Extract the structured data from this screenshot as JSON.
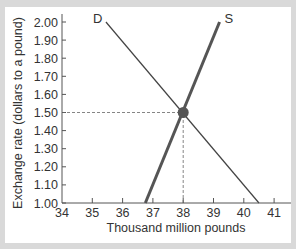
{
  "chart_data": {
    "type": "line",
    "title": "",
    "xlabel": "Thousand million pounds",
    "ylabel": "Exchange rate (dollars to a pound)",
    "xlim": [
      34,
      41.5
    ],
    "ylim": [
      1.0,
      2.05
    ],
    "xticks": [
      "34",
      "35",
      "36",
      "37",
      "38",
      "39",
      "40",
      "41"
    ],
    "yticks": [
      "1.00",
      "1.10",
      "1.20",
      "1.30",
      "1.40",
      "1.50",
      "1.60",
      "1.70",
      "1.80",
      "1.90",
      "2.00"
    ],
    "grid": false,
    "series": [
      {
        "name": "D",
        "label": "D",
        "points": [
          [
            35.45,
            2.0
          ],
          [
            40.5,
            1.0
          ]
        ],
        "color": "#444444",
        "width": 1.2
      },
      {
        "name": "S",
        "label": "S",
        "points": [
          [
            36.75,
            1.0
          ],
          [
            39.2,
            2.0
          ]
        ],
        "color": "#555555",
        "width": 3
      }
    ],
    "equilibrium": {
      "x": 38,
      "y": 1.5,
      "color": "#555555"
    },
    "reference_lines": [
      {
        "type": "horizontal",
        "y": 1.5,
        "from_x": 34,
        "to_x": 38,
        "style": "dashed"
      },
      {
        "type": "vertical",
        "x": 38,
        "from_y": 1.0,
        "to_y": 1.5,
        "style": "dashed"
      }
    ]
  },
  "colors": {
    "background": "#d9d9d9",
    "panel": "#ffffff",
    "axis": "#555555",
    "text": "#333333"
  }
}
